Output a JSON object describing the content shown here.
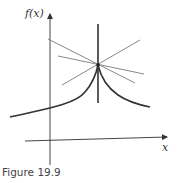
{
  "figure": {
    "caption": "Figure 19.9",
    "y_axis_label": "f(x)",
    "x_axis_label": "x"
  },
  "colors": {
    "axis": "#333333",
    "curve": "#333333",
    "tangent": "#888888"
  }
}
